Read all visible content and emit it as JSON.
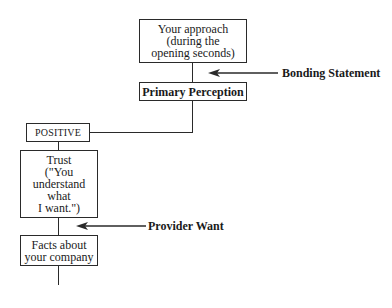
{
  "diagram": {
    "boxes": {
      "approach": "Your approach\n(during the\nopening seconds)",
      "primary_perception": "Primary Perception",
      "positive": "POSITIVE",
      "trust": "Trust\n(\"You\nunderstand\nwhat\nI want.\")",
      "facts": "Facts about\nyour company"
    },
    "annotations": {
      "bonding_statement": "Bonding Statement",
      "provider_want": "Provider Want"
    },
    "colors": {
      "line": "#2a2a2a",
      "background": "#ffffff"
    }
  }
}
